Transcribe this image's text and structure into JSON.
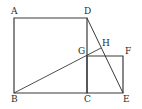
{
  "diagram": {
    "type": "geometry",
    "stroke_color": "#3a3a3a",
    "points": {
      "A": {
        "label": "A",
        "x": 14,
        "y": 18
      },
      "D": {
        "label": "D",
        "x": 87,
        "y": 18
      },
      "B": {
        "label": "B",
        "x": 14,
        "y": 93
      },
      "C": {
        "label": "C",
        "x": 87,
        "y": 93
      },
      "E": {
        "label": "E",
        "x": 123,
        "y": 93
      },
      "G": {
        "label": "G",
        "x": 87,
        "y": 56
      },
      "F": {
        "label": "F",
        "x": 123,
        "y": 56
      },
      "H": {
        "label": "H",
        "x": 101,
        "y": 48
      }
    },
    "shapes": [
      {
        "name": "square-ABCD",
        "vertices": [
          "A",
          "D",
          "C",
          "B"
        ]
      },
      {
        "name": "square-CEFG",
        "vertices": [
          "G",
          "F",
          "E",
          "C"
        ]
      }
    ],
    "segments": [
      {
        "name": "segment-DE",
        "from": "D",
        "to": "E"
      },
      {
        "name": "segment-BH",
        "from": "B",
        "to": "H"
      }
    ]
  }
}
